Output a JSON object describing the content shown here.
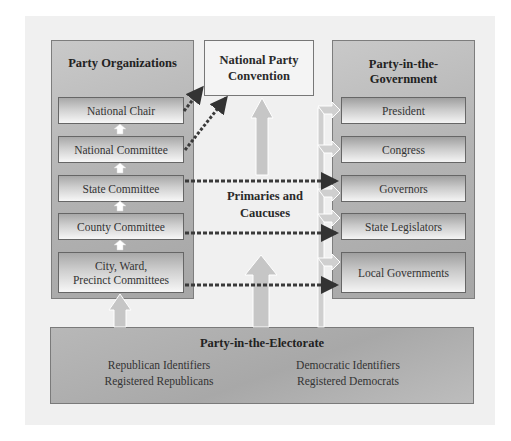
{
  "diagram": {
    "party_organizations": {
      "title": "Party Organizations",
      "levels": [
        "National Chair",
        "National Committee",
        "State Committee",
        "County Committee",
        "City, Ward, Precinct Committees"
      ],
      "city_line1": "City, Ward,",
      "city_line2": "Precinct Committees"
    },
    "convention": {
      "line1": "National Party",
      "line2": "Convention"
    },
    "primaries": {
      "line1": "Primaries and",
      "line2": "Caucuses"
    },
    "party_in_government": {
      "title_line1": "Party-in-the-",
      "title_line2": "Government",
      "offices": [
        "President",
        "Congress",
        "Governors",
        "State Legislators",
        "Local Governments"
      ]
    },
    "party_in_electorate": {
      "title": "Party-in-the-Electorate",
      "republican": [
        "Republican Identifiers",
        "Registered Republicans"
      ],
      "democratic": [
        "Democratic Identifiers",
        "Registered Democrats"
      ]
    },
    "colors": {
      "canvas_bg": "#f0f0f0",
      "panel_gray": "#b3b3b3",
      "dotted_arrow": "#3a3a3a",
      "light_arrow": "#c4c4c4"
    }
  }
}
